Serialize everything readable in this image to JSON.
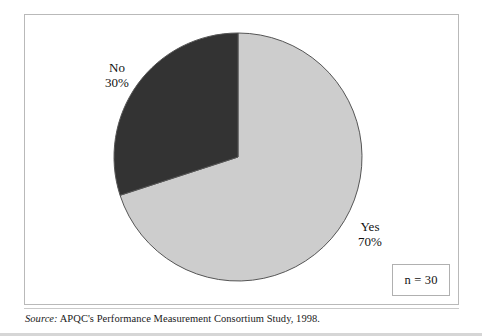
{
  "figure": {
    "frame_color": "#b9b9b9",
    "background": "#ffffff"
  },
  "sample_note": {
    "text": "n = 30",
    "border_color": "#b0b0b0"
  },
  "source": {
    "prefix": "Source:",
    "text": " APQC's Performance Measurement Consortium Study, 1998."
  },
  "labels": {
    "no": {
      "name": "No",
      "value": "30%"
    },
    "yes": {
      "name": "Yes",
      "value": "70%"
    }
  },
  "chart_data": {
    "type": "pie",
    "title": "",
    "subtitle": "",
    "xlabel": "",
    "ylabel": "",
    "grid": false,
    "legend": "none",
    "labels_position": "outside",
    "start_angle_deg": 0,
    "direction": "clockwise",
    "total_n": 30,
    "categories": [
      "Yes",
      "No"
    ],
    "values": [
      70,
      30
    ],
    "value_unit": "percent",
    "colors": [
      "#cdcdcd",
      "#333333"
    ],
    "slice_outline_color": "#555555",
    "annotations": [
      "n = 30"
    ],
    "slices": [
      {
        "label": "Yes",
        "value": 70,
        "display": "70%",
        "color": "#cdcdcd",
        "start_angle_deg": 0,
        "end_angle_deg": 252
      },
      {
        "label": "No",
        "value": 30,
        "display": "30%",
        "color": "#333333",
        "start_angle_deg": 252,
        "end_angle_deg": 360
      }
    ]
  }
}
